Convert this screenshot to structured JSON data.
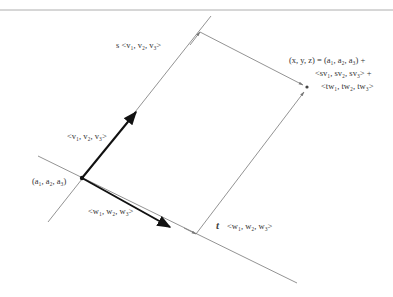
{
  "diagram": {
    "type": "vector-plane-parametric",
    "colors": {
      "thin_line": "#777777",
      "bold_vector": "#111111",
      "text": "#333333",
      "header_rule": "#999999"
    },
    "labels": {
      "origin_point": "(a₁, a₂, a₃)",
      "vector_v": "<v₁, v₂, v₃>",
      "vector_w": "<w₁, w₂, w₃>",
      "scaled_v": "s <v₁, v₂, v₃>",
      "scaled_w_coef": "t",
      "scaled_w": "<w₁, w₂, w₃>",
      "equation_line1": "(x, y, z) = (a₁, a₂, a₃) +",
      "equation_line2": "<sv₁, sv₂, sv₃> +",
      "equation_line3": "<tw₁, tw₂, tw₃>"
    },
    "points": {
      "origin": [
        82,
        178
      ],
      "v_tip": [
        136,
        112
      ],
      "w_tip": [
        170,
        227
      ],
      "s_v_corner": [
        200,
        32
      ],
      "t_w_corner": [
        196,
        234
      ],
      "result": [
        307,
        87
      ]
    }
  }
}
